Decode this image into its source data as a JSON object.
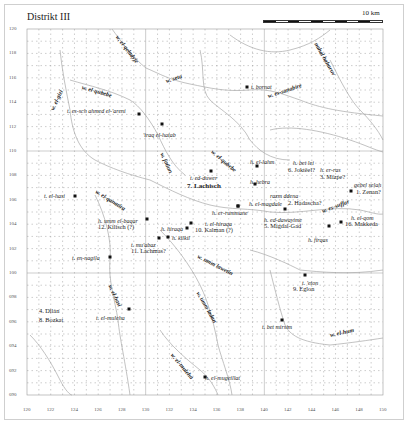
{
  "title": "Distrikt III",
  "scale": {
    "label": "10 km",
    "segments": 10
  },
  "axes": {
    "x_ticks": [
      "120",
      "122",
      "124",
      "126",
      "128",
      "130",
      "132",
      "134",
      "136",
      "138",
      "140",
      "142",
      "144",
      "146",
      "148",
      "150"
    ],
    "y_ticks": [
      "120",
      "118",
      "116",
      "114",
      "112",
      "110",
      "108",
      "106",
      "104",
      "102",
      "100",
      "098",
      "096",
      "094",
      "092",
      "090"
    ]
  },
  "sheet_marks": [
    "41",
    "44",
    "41",
    "42",
    "41",
    "41"
  ],
  "wadis": [
    {
      "name": "w. el-qeladyje",
      "x": 117,
      "y": 33,
      "rot": 52
    },
    {
      "name": "w. seta",
      "x": 166,
      "y": 78,
      "rot": -18
    },
    {
      "name": "w. es-sanabire",
      "x": 268,
      "y": 93,
      "rot": -18
    },
    {
      "name": "nahal haharuv",
      "x": 316,
      "y": 40,
      "rot": 60
    },
    {
      "name": "w. el-qubebe",
      "x": 82,
      "y": 84,
      "rot": 16
    },
    {
      "name": "w. el-gizi",
      "x": 52,
      "y": 107,
      "rot": -65
    },
    {
      "name": "w. fatiun",
      "x": 162,
      "y": 150,
      "rot": 65
    },
    {
      "name": "w. el-qubebe",
      "x": 212,
      "y": 148,
      "rot": 40
    },
    {
      "name": "w. el-qanatira",
      "x": 96,
      "y": 188,
      "rot": 32
    },
    {
      "name": "w. es-suffar",
      "x": 322,
      "y": 208,
      "rot": -20
    },
    {
      "name": "w. umm lawetin",
      "x": 198,
      "y": 253,
      "rot": 27
    },
    {
      "name": "w. el-hasi",
      "x": 110,
      "y": 282,
      "rot": 65
    },
    {
      "name": "w. umm ladan",
      "x": 198,
      "y": 289,
      "rot": 60
    },
    {
      "name": "w. el-hum",
      "x": 330,
      "y": 332,
      "rot": -12
    },
    {
      "name": "w. el-muleha",
      "x": 172,
      "y": 351,
      "rot": 50
    }
  ],
  "sites": [
    {
      "name": "t. bornat",
      "x": 251,
      "y": 84,
      "dot": true
    },
    {
      "name": "t. es-sch ahmed el-'areni",
      "x": 67,
      "y": 108,
      "dot": true,
      "dx": 139,
      "dy": 114
    },
    {
      "name": "'iraq el-hatab",
      "x": 143,
      "y": 132,
      "dot": true,
      "dx": 162,
      "dy": 124
    },
    {
      "name": "h. el-lahm",
      "x": 250,
      "y": 159,
      "dot": true,
      "dx": 257,
      "dy": 166
    },
    {
      "name": "h. bet lei",
      "x": 293,
      "y": 160,
      "dot": false
    },
    {
      "name": "h. er-ras",
      "x": 320,
      "y": 167,
      "dot": false
    },
    {
      "name": "h. hebra",
      "x": 250,
      "y": 179,
      "dot": true,
      "dx": 255,
      "dy": 184
    },
    {
      "name": "t. ed-duwer",
      "x": 190,
      "y": 175,
      "dot": true,
      "dx": 211,
      "dy": 171
    },
    {
      "name": "gebel selah",
      "x": 354,
      "y": 182,
      "dot": true,
      "dx": 351,
      "dy": 191
    },
    {
      "name": "razm ddena",
      "x": 270,
      "y": 193,
      "dot": false
    },
    {
      "name": "t. el-hasi",
      "x": 44,
      "y": 193,
      "dot": true,
      "dx": 75,
      "dy": 196
    },
    {
      "name": "h. el-magdale",
      "x": 249,
      "y": 201,
      "dot": true,
      "dx": 238,
      "dy": 206
    },
    {
      "name": "h. er-rummane",
      "x": 212,
      "y": 210,
      "dot": true,
      "dx": 238,
      "dy": 206
    },
    {
      "name": "h. umm el-baqar",
      "x": 98,
      "y": 218,
      "dot": true,
      "dx": 147,
      "dy": 219
    },
    {
      "name": "h. ed-dawayime",
      "x": 264,
      "y": 217,
      "dot": true,
      "dx": 285,
      "dy": 209
    },
    {
      "name": "h. el-qom",
      "x": 351,
      "y": 215,
      "dot": true,
      "dx": 341,
      "dy": 222
    },
    {
      "name": "t. el-hiraqa",
      "x": 205,
      "y": 221,
      "dot": true,
      "dx": 191,
      "dy": 223
    },
    {
      "name": "h. hiraqa",
      "x": 161,
      "y": 226,
      "dot": true,
      "dx": 187,
      "dy": 228
    },
    {
      "name": "h. kilkil",
      "x": 172,
      "y": 235,
      "dot": true,
      "dx": 168,
      "dy": 237
    },
    {
      "name": "h. firqas",
      "x": 308,
      "y": 237,
      "dot": true,
      "dx": 329,
      "dy": 226
    },
    {
      "name": "t. mu'abaz",
      "x": 131,
      "y": 242,
      "dot": true,
      "dx": 159,
      "dy": 238
    },
    {
      "name": "t. en-nagila",
      "x": 72,
      "y": 255,
      "dot": true,
      "dx": 110,
      "dy": 257
    },
    {
      "name": "t. 'eton",
      "x": 302,
      "y": 280,
      "dot": true,
      "dx": 305,
      "dy": 275
    },
    {
      "name": "t. el-muleha",
      "x": 96,
      "y": 315,
      "dot": true,
      "dx": 129,
      "dy": 309
    },
    {
      "name": "t. bet mirsim",
      "x": 262,
      "y": 324,
      "dot": true,
      "dx": 282,
      "dy": 320
    },
    {
      "name": "h. el-mugeillat",
      "x": 205,
      "y": 375,
      "dot": true,
      "dx": 205,
      "dy": 377
    }
  ],
  "places": [
    {
      "name": "7. Lachisch",
      "x": 187,
      "y": 183,
      "bold": true
    },
    {
      "name": "6. Joktëel?",
      "x": 288,
      "y": 167
    },
    {
      "name": "3. Mizpe?",
      "x": 320,
      "y": 174
    },
    {
      "name": "1. Zenan?",
      "x": 356,
      "y": 189
    },
    {
      "name": "2. Hadascha?",
      "x": 288,
      "y": 200
    },
    {
      "name": "12. Kilisch (?)",
      "x": 98,
      "y": 224
    },
    {
      "name": "10. Kalman (?)",
      "x": 195,
      "y": 227
    },
    {
      "name": "5. Migdal-Gad",
      "x": 264,
      "y": 223
    },
    {
      "name": "16. Makkeda",
      "x": 345,
      "y": 221
    },
    {
      "name": "11. Lachmas?",
      "x": 131,
      "y": 248
    },
    {
      "name": "9. Eglon",
      "x": 293,
      "y": 286
    },
    {
      "name": "4. Dilan",
      "x": 39,
      "y": 308
    },
    {
      "name": "8. Bozkat",
      "x": 39,
      "y": 317
    }
  ],
  "colors": {
    "grid": "#9a9a9a",
    "river": "#a8a8a8",
    "text": "#222222",
    "dot": "#111111",
    "frame": "#cfcfcf"
  }
}
